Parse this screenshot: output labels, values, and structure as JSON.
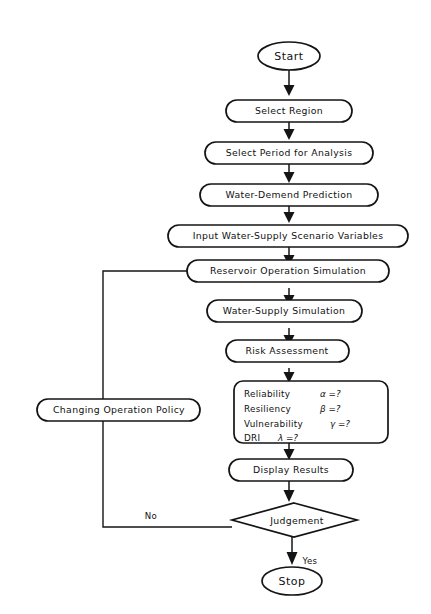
{
  "diagram": {
    "background_color": "#ffffff",
    "line_color": "#141414",
    "nodes": {
      "start": {
        "label": "Start",
        "shape": "ellipse"
      },
      "select_region": {
        "label": "Select Region",
        "shape": "rounded-rect"
      },
      "select_period": {
        "label": "Select Period for Analysis",
        "shape": "rounded-rect"
      },
      "water_demand": {
        "label": "Water-Demend Prediction",
        "shape": "rounded-rect"
      },
      "input_scenario": {
        "label": "Input Water-Supply Scenario Variables",
        "shape": "rounded-rect"
      },
      "reservoir_sim": {
        "label": "Reservoir Operation Simulation",
        "shape": "rounded-rect"
      },
      "water_supply_sim": {
        "label": "Water-Supply  Simulation",
        "shape": "rounded-rect"
      },
      "risk_assessment": {
        "label": "Risk  Assessment",
        "shape": "rounded-rect"
      },
      "display_results": {
        "label": "Display  Results",
        "shape": "rounded-rect"
      },
      "judgement": {
        "label": "Judgement",
        "shape": "diamond"
      },
      "stop": {
        "label": "Stop",
        "shape": "ellipse"
      },
      "changing_policy": {
        "label": "Changing Operation Policy",
        "shape": "rounded-rect"
      }
    },
    "metrics_box": {
      "rows": [
        {
          "name": "Reliability",
          "symbol": "α =?"
        },
        {
          "name": "Resiliency",
          "symbol": "β =?"
        },
        {
          "name": "Vulnerability",
          "symbol": "γ =?"
        },
        {
          "name": "DRI",
          "symbol": "λ =?"
        }
      ]
    },
    "branches": {
      "yes_label": "Yes",
      "no_label": "No"
    }
  }
}
